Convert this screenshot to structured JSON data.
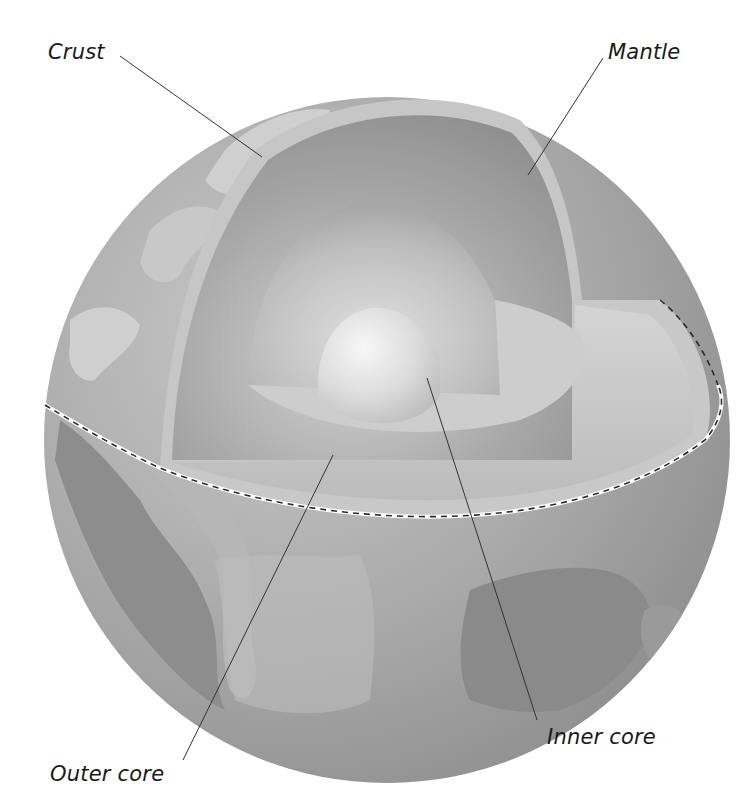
{
  "diagram": {
    "labels": {
      "crust": "Crust",
      "mantle": "Mantle",
      "outer_core": "Outer core",
      "inner_core": "Inner core"
    },
    "colors": {
      "background": "#ffffff",
      "ocean": "#a9a9a9",
      "land": "#cfcfcf",
      "land_dark": "#8a8a8a",
      "crust_band": "#bdbdbd",
      "mantle": "#9c9c9c",
      "outer_core": "#c4c4c4",
      "inner_core": "#ececec",
      "leader_line": "#333333",
      "equator_dash": "#2b2b2b"
    }
  }
}
